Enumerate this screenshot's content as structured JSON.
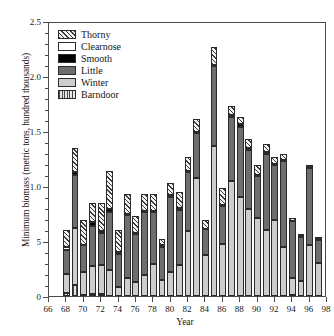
{
  "chart_data": {
    "type": "bar",
    "stacked": true,
    "title": "",
    "xlabel": "Year",
    "ylabel": "Minimum biomass (metric tons, hundred thousands)",
    "xlim": [
      66,
      98
    ],
    "ylim": [
      0,
      2.5
    ],
    "ytick_labels": [
      "0",
      "5",
      "1.0",
      "1.5",
      "2.0",
      "2.5"
    ],
    "ytick_values": [
      0,
      0.5,
      1.0,
      1.5,
      2.0,
      2.5
    ],
    "yminor_step": 0.1,
    "xtick_labels": [
      "66",
      "68",
      "70",
      "72",
      "74",
      "76",
      "78",
      "80",
      "82",
      "84",
      "86",
      "88",
      "90",
      "92",
      "94",
      "96",
      "98"
    ],
    "xtick_values": [
      66,
      68,
      70,
      72,
      74,
      76,
      78,
      80,
      82,
      84,
      86,
      88,
      90,
      92,
      94,
      96,
      98
    ],
    "grid": false,
    "legend_position": "upper-left",
    "legend_entries": [
      {
        "label": "Thorny",
        "fill": "thorny",
        "color": "#f2f2f2",
        "pattern": "diagonal-hatch"
      },
      {
        "label": "Clearnose",
        "fill": "clearnose",
        "color": "#ffffff",
        "pattern": "solid"
      },
      {
        "label": "Smooth",
        "fill": "smooth",
        "color": "#000000",
        "pattern": "solid"
      },
      {
        "label": "Little",
        "fill": "little",
        "color": "#6e6e6e",
        "pattern": "solid"
      },
      {
        "label": "Winter",
        "fill": "winter",
        "color": "#cdcdcd",
        "pattern": "solid"
      },
      {
        "label": "Barndoor",
        "fill": "barndoor",
        "color": "#e6e6e6",
        "pattern": "vertical-lines"
      }
    ],
    "series_order_bottom_to_top": [
      "Barndoor",
      "Winter",
      "Little",
      "Smooth",
      "Clearnose",
      "Thorny"
    ],
    "categories": [
      1968,
      1969,
      1970,
      1971,
      1972,
      1973,
      1974,
      1975,
      1976,
      1977,
      1978,
      1979,
      1980,
      1981,
      1982,
      1983,
      1984,
      1985,
      1986,
      1987,
      1988,
      1989,
      1990,
      1991,
      1992,
      1993,
      1994,
      1995,
      1996,
      1997
    ],
    "series": [
      {
        "name": "Barndoor",
        "values": [
          0.03,
          0.1,
          0.01,
          0.02,
          0.02,
          0.0,
          0.0,
          0.0,
          0.0,
          0.0,
          0.0,
          0.0,
          0.0,
          0.0,
          0.0,
          0.0,
          0.0,
          0.0,
          0.0,
          0.0,
          0.0,
          0.0,
          0.0,
          0.0,
          0.0,
          0.0,
          0.01,
          0.0,
          0.0,
          0.0
        ]
      },
      {
        "name": "Winter",
        "values": [
          0.17,
          0.52,
          0.21,
          0.25,
          0.26,
          0.24,
          0.08,
          0.16,
          0.13,
          0.19,
          0.29,
          0.15,
          0.22,
          0.28,
          0.59,
          1.07,
          0.37,
          1.36,
          0.47,
          1.05,
          0.9,
          0.79,
          0.71,
          0.6,
          0.69,
          0.45,
          0.15,
          0.14,
          0.46,
          0.3
        ]
      },
      {
        "name": "Little",
        "values": [
          0.22,
          0.48,
          0.24,
          0.37,
          0.29,
          0.52,
          0.3,
          0.58,
          0.43,
          0.57,
          0.47,
          0.3,
          0.68,
          0.5,
          0.54,
          0.41,
          0.24,
          0.73,
          0.35,
          0.58,
          0.64,
          0.54,
          0.38,
          0.69,
          0.5,
          0.78,
          0.52,
          0.4,
          0.7,
          0.21
        ]
      },
      {
        "name": "Smooth",
        "values": [
          0.0,
          0.03,
          0.0,
          0.03,
          0.02,
          0.03,
          0.02,
          0.01,
          0.01,
          0.01,
          0.01,
          0.01,
          0.02,
          0.02,
          0.01,
          0.01,
          0.0,
          0.01,
          0.01,
          0.02,
          0.02,
          0.02,
          0.01,
          0.02,
          0.01,
          0.01,
          0.0,
          0.01,
          0.01,
          0.01
        ]
      },
      {
        "name": "Clearnose",
        "values": [
          0.03,
          0.0,
          0.0,
          0.0,
          0.0,
          0.0,
          0.0,
          0.0,
          0.0,
          0.0,
          0.0,
          0.0,
          0.0,
          0.0,
          0.0,
          0.0,
          0.0,
          0.0,
          0.0,
          0.0,
          0.0,
          0.0,
          0.0,
          0.0,
          0.0,
          0.0,
          0.0,
          0.0,
          0.0,
          0.0
        ]
      },
      {
        "name": "Thorny",
        "values": [
          0.15,
          0.22,
          0.23,
          0.18,
          0.26,
          0.35,
          0.2,
          0.18,
          0.16,
          0.16,
          0.16,
          0.06,
          0.11,
          0.15,
          0.12,
          0.12,
          0.08,
          0.16,
          0.15,
          0.08,
          0.07,
          0.08,
          0.09,
          0.07,
          0.06,
          0.05,
          0.03,
          0.01,
          0.01,
          0.02
        ]
      }
    ],
    "totals": [
      0.6,
      1.35,
      0.69,
      0.85,
      0.83,
      1.55,
      0.6,
      0.93,
      0.73,
      0.93,
      0.85,
      0.52,
      1.03,
      0.96,
      1.27,
      1.61,
      0.69,
      2.26,
      0.98,
      1.73,
      1.63,
      1.43,
      1.19,
      1.38,
      1.26,
      1.29,
      0.71,
      0.56,
      1.18,
      0.54
    ]
  }
}
